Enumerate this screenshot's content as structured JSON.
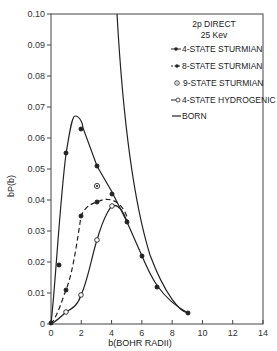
{
  "chart_data": {
    "type": "line",
    "title": "2p DIRECT 25 Kev",
    "xlabel": "b(BOHR RADII)",
    "ylabel": "bP(b)",
    "xlim": [
      0,
      14
    ],
    "ylim": [
      0,
      0.1
    ],
    "xticks": [
      "0",
      "2",
      "4",
      "6",
      "8",
      "10",
      "12",
      "14"
    ],
    "yticks": [
      "0",
      "0.01",
      "0.02",
      "0.03",
      "0.04",
      "0.05",
      "0.06",
      "0.07",
      "0.08",
      "0.09",
      "0.10"
    ],
    "grid": false,
    "legend_position": "upper right",
    "legend": {
      "line1": "2p DIRECT",
      "line2": "25 Kev",
      "entries": [
        "4-STATE STURMIAN",
        "8-STATE STURMIAN",
        "9-STATE STURMIAN",
        "4-STATE HYDROGENIC",
        "BORN"
      ]
    },
    "series": [
      {
        "name": "4-STATE STURMIAN",
        "marker": "filled-dot",
        "line": "solid",
        "x": [
          0,
          0.5,
          1,
          2,
          3,
          4,
          5,
          6,
          7,
          9
        ],
        "y": [
          0,
          0.019,
          0.055,
          0.063,
          0.051,
          0.042,
          0.033,
          0.022,
          0.012,
          0.0035
        ]
      },
      {
        "name": "8-STATE STURMIAN",
        "marker": "filled-dot",
        "line": "dashed",
        "x": [
          0,
          1,
          2,
          3,
          4,
          4.5,
          5
        ],
        "y": [
          0,
          0.011,
          0.035,
          0.0395,
          0.038,
          0.036,
          0.033
        ]
      },
      {
        "name": "9-STATE STURMIAN",
        "marker": "dotted-circle",
        "line": "none",
        "x": [
          3
        ],
        "y": [
          0.0445
        ]
      },
      {
        "name": "4-STATE HYDROGENIC",
        "marker": "open-circle",
        "line": "solid",
        "x": [
          0,
          1,
          2,
          3,
          4,
          4.5,
          5
        ],
        "y": [
          0,
          0.004,
          0.0095,
          0.027,
          0.038,
          0.037,
          0.033
        ]
      },
      {
        "name": "BORN",
        "marker": "none",
        "line": "solid",
        "x": [
          4.4,
          5,
          6,
          7,
          8,
          9
        ],
        "y": [
          0.1,
          0.068,
          0.035,
          0.018,
          0.008,
          0.0035
        ]
      }
    ]
  }
}
